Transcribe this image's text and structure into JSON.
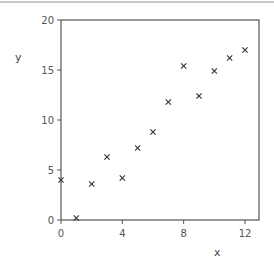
{
  "chart_data": {
    "type": "scatter",
    "title": "",
    "xlabel": "x",
    "ylabel": "y",
    "xlim": [
      0,
      12.9
    ],
    "ylim": [
      0,
      20
    ],
    "xticks": [
      0,
      4,
      8,
      12
    ],
    "yticks": [
      0,
      5,
      10,
      15,
      20
    ],
    "grid": false,
    "legend": null,
    "marker": "x",
    "series": [
      {
        "name": "data",
        "x": [
          0,
          1,
          2,
          3,
          4,
          5,
          6,
          7,
          8,
          9,
          10,
          11,
          12
        ],
        "y": [
          4.0,
          0.2,
          3.6,
          6.3,
          4.2,
          7.2,
          8.8,
          11.8,
          15.4,
          12.4,
          14.9,
          16.2,
          17.0
        ]
      }
    ]
  },
  "labels": {
    "x_axis": "x",
    "y_axis": "y",
    "x_ticks": [
      "0",
      "4",
      "8",
      "12"
    ],
    "y_ticks": [
      "0",
      "5",
      "10",
      "15",
      "20"
    ],
    "marker_glyph": "×"
  },
  "colors": {
    "axis": "#555555",
    "marker": "#333333",
    "text": "#555555"
  }
}
